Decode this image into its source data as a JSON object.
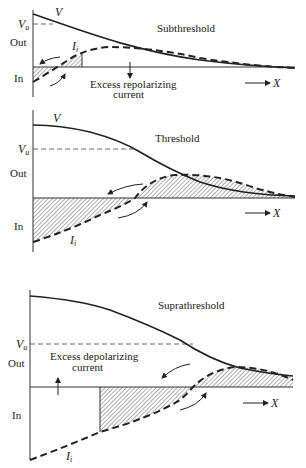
{
  "figure": {
    "panels": [
      {
        "title": "Subthreshold",
        "v_label": "V",
        "vu_label": "V",
        "vu_sub": "u",
        "out_label": "Out",
        "in_label": "In",
        "ii_label": "I",
        "ii_sub": "i",
        "x_label": "X",
        "annotation_line1": "Excess repolarizing",
        "annotation_line2": "current"
      },
      {
        "title": "Threshold",
        "v_label": "V",
        "vu_label": "V",
        "vu_sub": "u",
        "out_label": "Out",
        "in_label": "In",
        "ii_label": "I",
        "ii_sub": "i",
        "x_label": "X"
      },
      {
        "title": "Suprathreshold",
        "vu_label": "V",
        "vu_sub": "u",
        "out_label": "Out",
        "in_label": "In",
        "ii_label": "I",
        "ii_sub": "i",
        "x_label": "X",
        "annotation_line1": "Excess depolarizing",
        "annotation_line2": "current"
      }
    ]
  }
}
